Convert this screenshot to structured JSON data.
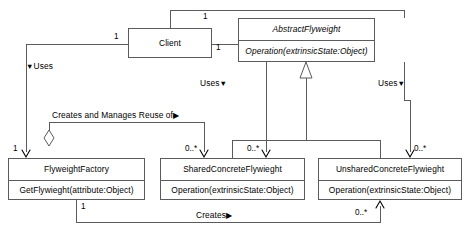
{
  "diagram": {
    "kind": "uml-class-diagram",
    "stroke_color": "#5b5b5b",
    "text_color": "#000000",
    "background": "#ffffff"
  },
  "classes": [
    {
      "id": "client",
      "name": "Client",
      "abstract": false,
      "operations": []
    },
    {
      "id": "abstract_flyweight",
      "name": "AbstractFlyweight",
      "abstract": true,
      "operations": [
        "Operation(extrinsicState:Object)"
      ]
    },
    {
      "id": "flyweight_factory",
      "name": "FlyweightFactory",
      "abstract": false,
      "operations": [
        "GetFlywieght(attribute:Object)"
      ]
    },
    {
      "id": "shared_concrete_flyweight",
      "name": "SharedConcreteFlywieght",
      "abstract": false,
      "operations": [
        "Operation(extrinsicState:Object)"
      ]
    },
    {
      "id": "unshared_concrete_flyweight",
      "name": "UnsharedConcreteFlywieght",
      "abstract": false,
      "operations": [
        "Operation(extrinsicState:Object)"
      ]
    }
  ],
  "relationship_labels": {
    "uses_left": "Uses",
    "uses_center": "Uses",
    "uses_right": "Uses",
    "creates_and_manages": "Creates and Manages Reuse of",
    "creates": "Creates"
  },
  "multiplicities": {
    "client_top": "1",
    "client_left": "1",
    "client_right": "1",
    "factory_left": "1",
    "factory_bottom": "1",
    "shared_left": "0..*",
    "shared_right": "0..*",
    "unshared_right": "0..*",
    "unshared_bottom": "0..*"
  },
  "glyphs": {
    "triangle_down": "▼",
    "triangle_right": "▶"
  }
}
